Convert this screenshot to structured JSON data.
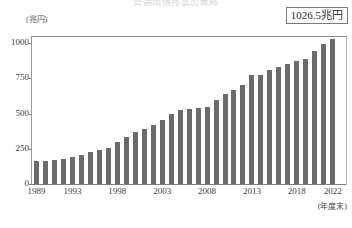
{
  "chart_data": {
    "type": "bar",
    "title": "普通国債残高の推移",
    "xlabel": "(年度末)",
    "ylabel": "(兆円)",
    "ylim": [
      0,
      1050
    ],
    "yticks": [
      0,
      250,
      500,
      750,
      1000
    ],
    "ytick_labels": [
      "0",
      "250",
      "500",
      "750",
      "1000"
    ],
    "grid": false,
    "legend": null,
    "reference_line": {
      "value": 1000,
      "label": ""
    },
    "annotation": {
      "text": "1026.5兆円",
      "points_to_category": "2022"
    },
    "bar_color": "#6b6b6b",
    "categories": [
      "1989",
      "1990",
      "1991",
      "1992",
      "1993",
      "1994",
      "1995",
      "1996",
      "1997",
      "1998",
      "1999",
      "2000",
      "2001",
      "2002",
      "2003",
      "2004",
      "2005",
      "2006",
      "2007",
      "2008",
      "2009",
      "2010",
      "2011",
      "2012",
      "2013",
      "2014",
      "2015",
      "2016",
      "2017",
      "2018",
      "2019",
      "2020",
      "2021",
      "2022"
    ],
    "values": [
      160.9,
      166.3,
      171.6,
      178.4,
      192.5,
      206.6,
      225.2,
      244.7,
      258.0,
      295.2,
      331.7,
      367.6,
      392.4,
      421.1,
      457.0,
      499.0,
      527.0,
      532.0,
      541.5,
      545.9,
      593.9,
      636.3,
      669.9,
      705.0,
      770.0,
      774.0,
      805.4,
      830.6,
      853.2,
      874.0,
      886.7,
      946.6,
      991.4,
      1026.5
    ],
    "xtick_labels": [
      "1989",
      "1993",
      "1998",
      "2003",
      "2008",
      "2013",
      "2018",
      "2022"
    ],
    "xtick_categories": [
      "1989",
      "1993",
      "1998",
      "2003",
      "2008",
      "2013",
      "2018",
      "2022"
    ]
  },
  "callout": {
    "value_label": "1026.5兆円"
  },
  "axes": {
    "y_unit": "(兆円)",
    "x_note": "(年度末)"
  }
}
